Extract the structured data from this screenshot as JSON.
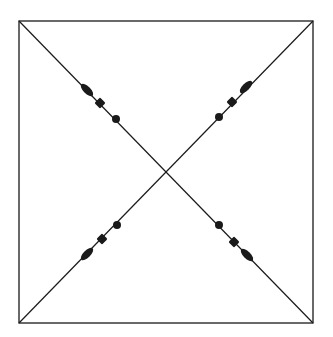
{
  "diagram": {
    "colors": {
      "stroke": "#1a1a1a",
      "background": "#ffffff"
    },
    "square": {
      "x1": 19,
      "y1": 21,
      "x2": 313,
      "y2": 323
    },
    "markers": [
      {
        "id": "tl-diamond",
        "shape": "diamond",
        "x": 87,
        "y": 90
      },
      {
        "id": "tl-square",
        "shape": "square",
        "x": 100,
        "y": 103
      },
      {
        "id": "tl-dot",
        "shape": "dot",
        "x": 116,
        "y": 119
      },
      {
        "id": "tr-diamond",
        "shape": "diamond",
        "x": 246,
        "y": 87
      },
      {
        "id": "tr-square",
        "shape": "square",
        "x": 232,
        "y": 102
      },
      {
        "id": "tr-dot",
        "shape": "dot",
        "x": 219,
        "y": 117
      },
      {
        "id": "bl-diamond",
        "shape": "diamond",
        "x": 87,
        "y": 254
      },
      {
        "id": "bl-square",
        "shape": "square",
        "x": 102,
        "y": 239
      },
      {
        "id": "bl-dot",
        "shape": "dot",
        "x": 117,
        "y": 225
      },
      {
        "id": "br-diamond",
        "shape": "diamond",
        "x": 247,
        "y": 255
      },
      {
        "id": "br-square",
        "shape": "square",
        "x": 234,
        "y": 242
      },
      {
        "id": "br-dot",
        "shape": "dot",
        "x": 219,
        "y": 225
      }
    ]
  }
}
